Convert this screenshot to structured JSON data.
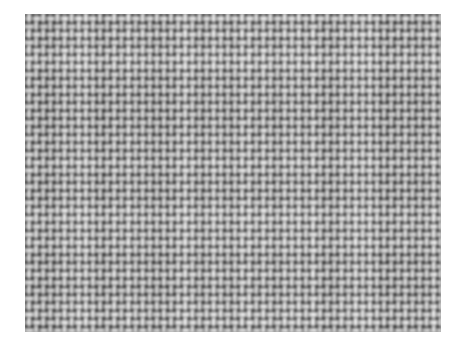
{
  "image": {
    "subject": "woven-fabric-texture",
    "description": "Grayscale close-up photograph of a plain-weave textile (canvas) showing a regular grid of interlacing warp and weft yarns",
    "colorspace": "grayscale",
    "background_color": "#ffffff",
    "canvas": {
      "width": 465,
      "height": 361
    },
    "texture_region": {
      "x": 25,
      "y": 14,
      "width": 416,
      "height": 318
    },
    "weave": {
      "type": "plain-weave",
      "warp_period_px": 7.1,
      "weft_period_px": 8.0,
      "warp_count": 59,
      "weft_count": 40,
      "knot_highlight_color": "#dcdcdc",
      "yarn_midtone_color": "#a2a2a2",
      "interstice_shadow_color": "#5e5e5e",
      "base_color": "#9e9e9e",
      "grain_amount": 0.16,
      "blur_px": 0.8,
      "tone_min": 64,
      "tone_max": 226,
      "tone_mean": 158
    }
  }
}
